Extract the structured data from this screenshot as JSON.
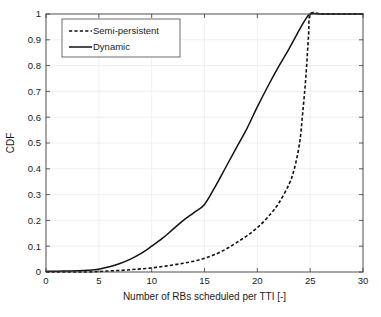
{
  "chart_data": {
    "type": "line",
    "title": "",
    "xlabel": "Number of RBs scheduled per TTI [-]",
    "ylabel": "CDF",
    "xlim": [
      0,
      30
    ],
    "ylim": [
      0,
      1
    ],
    "xticks": [
      "0",
      "5",
      "10",
      "15",
      "20",
      "25",
      "30"
    ],
    "yticks": [
      "0",
      "0.1",
      "0.2",
      "0.3",
      "0.4",
      "0.5",
      "0.6",
      "0.7",
      "0.8",
      "0.9",
      "1"
    ],
    "grid": true,
    "legend_position": "top-left-inside",
    "series": [
      {
        "name": "Semi-persistent",
        "style": "dashed",
        "color": "#111111",
        "x": [
          0,
          1,
          2,
          3,
          4,
          5,
          6,
          7,
          8,
          9,
          10,
          11,
          12,
          13,
          14,
          15,
          16,
          17,
          18,
          19,
          20,
          21,
          22,
          23,
          23.5,
          24,
          24.3,
          24.6,
          24.85,
          25,
          26,
          27,
          28,
          29,
          30
        ],
        "y": [
          0,
          0,
          0,
          0,
          0,
          0.002,
          0.004,
          0.006,
          0.009,
          0.012,
          0.016,
          0.021,
          0.027,
          0.034,
          0.042,
          0.053,
          0.068,
          0.088,
          0.113,
          0.14,
          0.172,
          0.213,
          0.265,
          0.34,
          0.4,
          0.5,
          0.62,
          0.76,
          0.92,
          1,
          1,
          1,
          1,
          1,
          1
        ]
      },
      {
        "name": "Dynamic",
        "style": "solid",
        "color": "#111111",
        "x": [
          0,
          1,
          2,
          3,
          4,
          5,
          6,
          7,
          8,
          9,
          10,
          11,
          12,
          13,
          14,
          15,
          16,
          17,
          18,
          19,
          20,
          21,
          22,
          23,
          24,
          24.5,
          25,
          26,
          27,
          28,
          29,
          30
        ],
        "y": [
          0.003,
          0.003,
          0.004,
          0.005,
          0.007,
          0.011,
          0.02,
          0.033,
          0.05,
          0.072,
          0.1,
          0.13,
          0.165,
          0.2,
          0.23,
          0.262,
          0.33,
          0.405,
          0.48,
          0.555,
          0.64,
          0.72,
          0.795,
          0.865,
          0.94,
          0.975,
          1,
          1,
          1,
          1,
          1,
          1
        ]
      }
    ]
  },
  "legend": {
    "entries": [
      {
        "label": "Semi-persistent"
      },
      {
        "label": "Dynamic"
      }
    ]
  }
}
